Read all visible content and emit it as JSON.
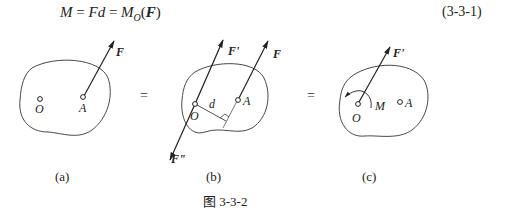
{
  "equation": {
    "lhs": "M",
    "eq1": " = ",
    "mid": "Fd",
    "eq2": " = ",
    "rhs_symbol": "M",
    "rhs_sub": "O",
    "rhs_open": "(",
    "rhs_vector": "F",
    "rhs_close": ")",
    "number": "(3-3-1)"
  },
  "figures": {
    "a": {
      "sublabel": "(a)",
      "point_o": "O",
      "point_a": "A",
      "force": "F"
    },
    "equals_1": "=",
    "b": {
      "sublabel": "(b)",
      "point_o": "O",
      "point_a": "A",
      "force": "F",
      "force_prime": "F'",
      "force_double_prime": "F\"",
      "distance": "d"
    },
    "equals_2": "=",
    "c": {
      "sublabel": "(c)",
      "point_o": "O",
      "point_a": "A",
      "force_prime": "F'",
      "moment": "M"
    }
  },
  "caption": "图 3-3-2",
  "colors": {
    "stroke": "#333333",
    "text": "#222222",
    "background": "#ffffff"
  }
}
